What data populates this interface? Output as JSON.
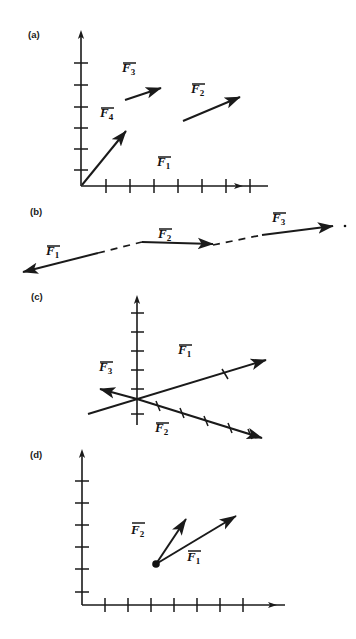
{
  "figure": {
    "background_color": "#ffffff",
    "ink_color": "#1a1a1a",
    "panels": [
      {
        "id": "a",
        "label": "(a)",
        "description": "Two-dimensional axes with four force vectors drawn as separate arrows",
        "axes": {
          "type": "quadrant-1",
          "x_axis_ticks": 7,
          "y_axis_ticks": 6,
          "x_arrowhead": true,
          "y_arrowhead": true
        },
        "vectors": [
          {
            "name": "F1",
            "label": "F",
            "subscript": "1",
            "direction": "along-x-axis",
            "arrow_drawn": false
          },
          {
            "name": "F2",
            "label": "F",
            "subscript": "2",
            "direction": "up-right",
            "arrow_drawn": true
          },
          {
            "name": "F3",
            "label": "F",
            "subscript": "3",
            "direction": "up-right",
            "arrow_drawn": true
          },
          {
            "name": "F4",
            "label": "F",
            "subscript": "4",
            "direction": "up-right-steep",
            "arrow_drawn": true
          }
        ]
      },
      {
        "id": "b",
        "label": "(b)",
        "description": "Three collinear vectors along one shallow line with dashed connecting gaps",
        "axes": {
          "type": "none"
        },
        "vectors": [
          {
            "name": "F1",
            "label": "F",
            "subscript": "1",
            "direction": "left",
            "arrow_drawn": true
          },
          {
            "name": "F2",
            "label": "F",
            "subscript": "2",
            "direction": "right",
            "arrow_drawn": true
          },
          {
            "name": "F3",
            "label": "F",
            "subscript": "3",
            "direction": "right",
            "arrow_drawn": true
          }
        ]
      },
      {
        "id": "c",
        "label": "(c)",
        "description": "Vertical axis with three vectors radiating through a common origin",
        "axes": {
          "type": "vertical-only",
          "y_axis_ticks": 6,
          "y_arrowhead": true
        },
        "vectors": [
          {
            "name": "F1",
            "label": "F",
            "subscript": "1",
            "direction": "up-right",
            "arrow_drawn": true
          },
          {
            "name": "F2",
            "label": "F",
            "subscript": "2",
            "direction": "down-right",
            "arrow_drawn": true
          },
          {
            "name": "F3",
            "label": "F",
            "subscript": "3",
            "direction": "left",
            "arrow_drawn": true
          }
        ]
      },
      {
        "id": "d",
        "label": "(d)",
        "description": "Axes with two vectors emanating from a common filled point",
        "axes": {
          "type": "quadrant-1",
          "x_axis_ticks": 7,
          "y_axis_ticks": 6,
          "x_arrowhead": true,
          "y_arrowhead": true
        },
        "origin_marker": "filled-dot",
        "vectors": [
          {
            "name": "F1",
            "label": "F",
            "subscript": "1",
            "direction": "up-right",
            "arrow_drawn": true
          },
          {
            "name": "F2",
            "label": "F",
            "subscript": "2",
            "direction": "up-steep",
            "arrow_drawn": true
          }
        ]
      }
    ]
  }
}
